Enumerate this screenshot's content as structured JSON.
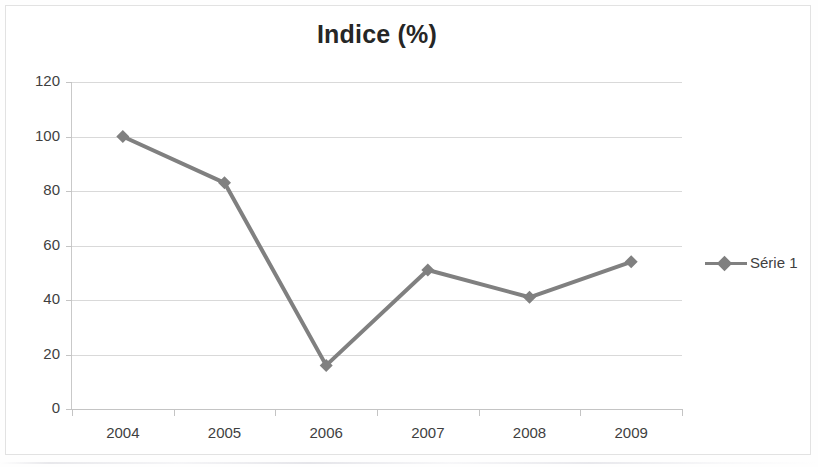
{
  "chart_data": {
    "type": "line",
    "title": "Indice (%)",
    "xlabel": "",
    "ylabel": "",
    "categories": [
      "2004",
      "2005",
      "2006",
      "2007",
      "2008",
      "2009"
    ],
    "series": [
      {
        "name": "Série 1",
        "values": [
          100,
          83,
          16,
          51,
          41,
          54
        ],
        "color": "#808080",
        "marker": "diamond"
      }
    ],
    "ylim": [
      0,
      120
    ],
    "ytick_step": 20,
    "yticks": [
      "0",
      "20",
      "40",
      "60",
      "80",
      "100",
      "120"
    ],
    "grid": true,
    "legend_position": "right"
  },
  "legend": {
    "entries": [
      {
        "label": "Série 1"
      }
    ]
  },
  "colors": {
    "series": "#808080",
    "gridline": "#d9d9d9",
    "axis": "#c4c4c4",
    "text": "#3f3f3f",
    "title": "#262626",
    "frame": "#e2e2e2"
  }
}
